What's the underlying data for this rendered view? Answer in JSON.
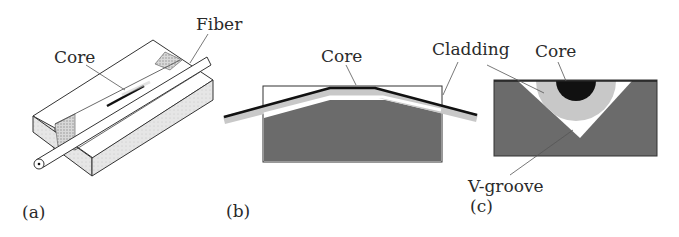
{
  "panels": {
    "a": {
      "caption": "(a)",
      "labels": {
        "core": "Core",
        "fiber": "Fiber"
      }
    },
    "b": {
      "caption": "(b)",
      "labels": {
        "core": "Core",
        "cladding": "Cladding"
      }
    },
    "c": {
      "caption": "(c)",
      "labels": {
        "core": "Core",
        "vgroove": "V-groove"
      }
    }
  },
  "colors": {
    "substrate_dark": "#6b6b6b",
    "block_light": "#f2f2f2",
    "block_side": "#dcdcdc",
    "cladding": "#c8c8c8",
    "core": "#111111",
    "outline": "#333333"
  }
}
